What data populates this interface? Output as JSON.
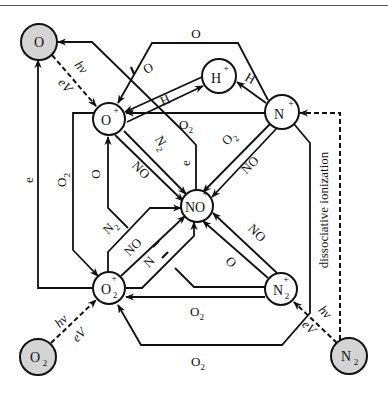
{
  "nodes": {
    "O": {
      "label": "O",
      "charge": "",
      "sub": "",
      "neutral": true
    },
    "Op": {
      "label": "O",
      "charge": "+",
      "sub": "",
      "neutral": false
    },
    "Hp": {
      "label": "H",
      "charge": "+",
      "sub": "",
      "neutral": false
    },
    "Np": {
      "label": "N",
      "charge": "+",
      "sub": "",
      "neutral": false
    },
    "NOp": {
      "label": "NO",
      "charge": "+",
      "sub": "",
      "neutral": false
    },
    "O2p": {
      "label": "O",
      "charge": "+",
      "sub": "2",
      "neutral": false
    },
    "N2p": {
      "label": "N",
      "charge": "+",
      "sub": "2",
      "neutral": false
    },
    "O2": {
      "label": "O",
      "charge": "",
      "sub": "2",
      "neutral": true
    },
    "N2": {
      "label": "N",
      "charge": "",
      "sub": "2",
      "neutral": true
    }
  },
  "edges": [
    {
      "from": "Np",
      "to": "Op",
      "label": "O"
    },
    {
      "from": "Hp",
      "to": "Op",
      "label": "O"
    },
    {
      "from": "Op",
      "to": "Hp",
      "label": "H"
    },
    {
      "from": "Np",
      "to": "Hp",
      "label": "H"
    },
    {
      "from": "Np",
      "to": "Op",
      "label": "O2",
      "sub": "2"
    },
    {
      "from": "Op",
      "to": "NOp",
      "label": "N2",
      "sub": "2"
    },
    {
      "from": "Op",
      "to": "NOp",
      "label": "NO"
    },
    {
      "from": "NOp",
      "to": "O",
      "label": "e"
    },
    {
      "from": "Np",
      "to": "NOp",
      "label": "O2",
      "sub": "2"
    },
    {
      "from": "Np",
      "to": "NOp",
      "label": "NO"
    },
    {
      "from": "O2p",
      "to": "O",
      "label": "e"
    },
    {
      "from": "Op",
      "to": "O2p",
      "label": "O2",
      "sub": "2"
    },
    {
      "from": "O2p",
      "to": "Op",
      "label": "O"
    },
    {
      "from": "O2p",
      "to": "NOp",
      "label": "N2",
      "sub": "2"
    },
    {
      "from": "O2p",
      "to": "NOp",
      "label": "NO"
    },
    {
      "from": "O2p",
      "to": "NOp",
      "label": "N"
    },
    {
      "from": "N2p",
      "to": "NOp",
      "label": "O"
    },
    {
      "from": "N2p",
      "to": "NOp",
      "label": "NO"
    },
    {
      "from": "N2p",
      "to": "O2p",
      "label": "O2",
      "sub": "2"
    },
    {
      "from": "Np",
      "to": "O2p",
      "label": "O2",
      "sub": "2"
    },
    {
      "from": "O",
      "to": "Op",
      "label": "hν / eV",
      "dashed": true
    },
    {
      "from": "O2",
      "to": "O2p",
      "label": "hν / eV",
      "dashed": true
    },
    {
      "from": "N2",
      "to": "N2p",
      "label": "hν / eV",
      "dashed": true
    },
    {
      "from": "N2",
      "to": "Np",
      "label": "dissociative ionization",
      "dashed": true
    }
  ],
  "labels": {
    "hv": "hν",
    "ev": "eV",
    "e": "e",
    "O": "O",
    "H": "H",
    "N": "N",
    "NO": "NO",
    "O2_main": "O",
    "two": "2",
    "dissociative": "dissociative ionization"
  }
}
